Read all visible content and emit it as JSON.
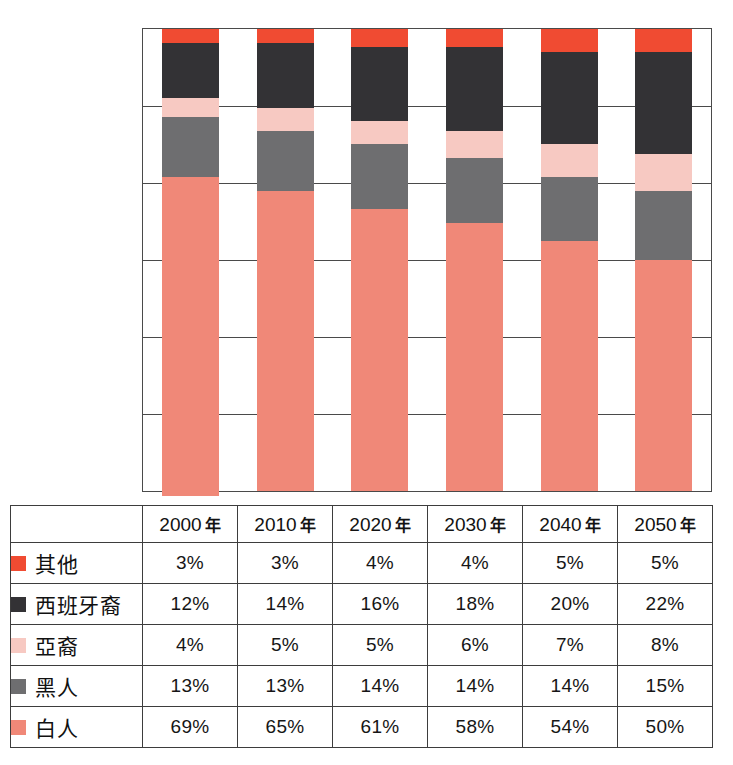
{
  "chart_data": {
    "type": "bar",
    "stacked": true,
    "normalized_percent": true,
    "title": "",
    "subtitle": "",
    "xlabel": "",
    "ylabel": "",
    "ylim": [
      0,
      100
    ],
    "grid": true,
    "gridline_count": 6,
    "legend_position": "table-row-labels",
    "categories": [
      "2000 年",
      "2010 年",
      "2020 年",
      "2030 年",
      "2040 年",
      "2050 年"
    ],
    "stack_order_bottom_to_top": [
      "白人",
      "黑人",
      "亞裔",
      "西班牙裔",
      "其他"
    ],
    "series": [
      {
        "name": "其他",
        "color": "#F04B32",
        "values": [
          3,
          3,
          4,
          4,
          5,
          5
        ],
        "value_labels": [
          "3%",
          "3%",
          "4%",
          "4%",
          "5%",
          "5%"
        ]
      },
      {
        "name": "西班牙裔",
        "color": "#333235",
        "values": [
          12,
          14,
          16,
          18,
          20,
          22
        ],
        "value_labels": [
          "12%",
          "14%",
          "16%",
          "18%",
          "20%",
          "22%"
        ]
      },
      {
        "name": "亞裔",
        "color": "#F7C9C2",
        "values": [
          4,
          5,
          5,
          6,
          7,
          8
        ],
        "value_labels": [
          "4%",
          "5%",
          "5%",
          "6%",
          "7%",
          "8%"
        ]
      },
      {
        "name": "黑人",
        "color": "#6E6E70",
        "values": [
          13,
          13,
          14,
          14,
          14,
          15
        ],
        "value_labels": [
          "13%",
          "13%",
          "14%",
          "14%",
          "14%",
          "15%"
        ]
      },
      {
        "name": "白人",
        "color": "#F08878",
        "values": [
          69,
          65,
          61,
          58,
          54,
          50
        ],
        "value_labels": [
          "69%",
          "65%",
          "61%",
          "58%",
          "54%",
          "50%"
        ]
      }
    ]
  },
  "table": {
    "corner_label": "",
    "column_headers": [
      {
        "year": "2000",
        "suffix": "年"
      },
      {
        "year": "2010",
        "suffix": "年"
      },
      {
        "year": "2020",
        "suffix": "年"
      },
      {
        "year": "2030",
        "suffix": "年"
      },
      {
        "year": "2040",
        "suffix": "年"
      },
      {
        "year": "2050",
        "suffix": "年"
      }
    ],
    "rows": [
      {
        "label": "其他",
        "swatch_color": "#F04B32",
        "values": [
          "3%",
          "3%",
          "4%",
          "4%",
          "5%",
          "5%"
        ]
      },
      {
        "label": "西班牙裔",
        "swatch_color": "#333235",
        "values": [
          "12%",
          "14%",
          "16%",
          "18%",
          "20%",
          "22%"
        ]
      },
      {
        "label": "亞裔",
        "swatch_color": "#F7C9C2",
        "values": [
          "4%",
          "5%",
          "5%",
          "6%",
          "7%",
          "8%"
        ]
      },
      {
        "label": "黑人",
        "swatch_color": "#6E6E70",
        "values": [
          "13%",
          "13%",
          "14%",
          "14%",
          "14%",
          "15%"
        ]
      },
      {
        "label": "白人",
        "swatch_color": "#F08878",
        "values": [
          "69%",
          "65%",
          "61%",
          "58%",
          "54%",
          "50%"
        ]
      }
    ]
  },
  "colors": {
    "other": "#F04B32",
    "hispanic": "#333235",
    "asian": "#F7C9C2",
    "black": "#6E6E70",
    "white": "#F08878",
    "grid": "#4a4a4a",
    "table_border": "#3d3d3d",
    "background": "#ffffff"
  }
}
